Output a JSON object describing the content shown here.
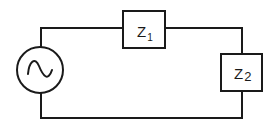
{
  "diagram": {
    "type": "series AC circuit",
    "source": {
      "kind": "AC voltage source",
      "icon": "sine-wave-icon"
    },
    "components": [
      {
        "id": "z1",
        "label": "Z",
        "subscript": "1",
        "position": "top wire"
      },
      {
        "id": "z2",
        "label": "Z",
        "subscript": "2",
        "position": "right wire"
      }
    ],
    "colors": {
      "line": "#1a1a1a",
      "background": "#ffffff"
    }
  }
}
